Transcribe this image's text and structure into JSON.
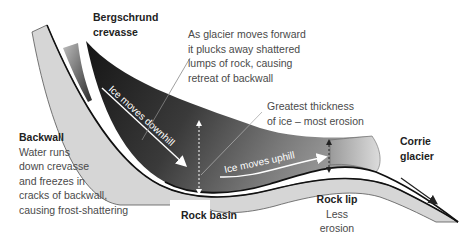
{
  "diagram": {
    "labels": {
      "bergschrund": [
        "Bergschrund",
        "crevasse"
      ],
      "plucking": [
        "As glacier moves forward",
        "it plucks away shattered",
        "lumps of rock, causing",
        "retreat of backwall"
      ],
      "thickness": [
        "Greatest thickness",
        "of ice – most erosion"
      ],
      "corrie": [
        "Corrie",
        "glacier"
      ],
      "backwall_title": "Backwall",
      "backwall_desc": [
        "Water runs",
        "down crevasse",
        "and freezes in",
        "cracks of backwall,",
        "causing frost-shattering"
      ],
      "rock_basin": "Rock basin",
      "rock_lip_title": "Rock lip",
      "rock_lip_desc": [
        "Less",
        "erosion"
      ],
      "ice_downhill": "Ice moves downhill",
      "ice_uphill": "Ice moves uphill"
    },
    "colors": {
      "ice_dark": "#1c1c1c",
      "ice_mid": "#6e6e6e",
      "rock": "#d6d6d6",
      "rock_outline": "#555555",
      "text": "#4a4a4a",
      "background": "#ffffff"
    }
  }
}
